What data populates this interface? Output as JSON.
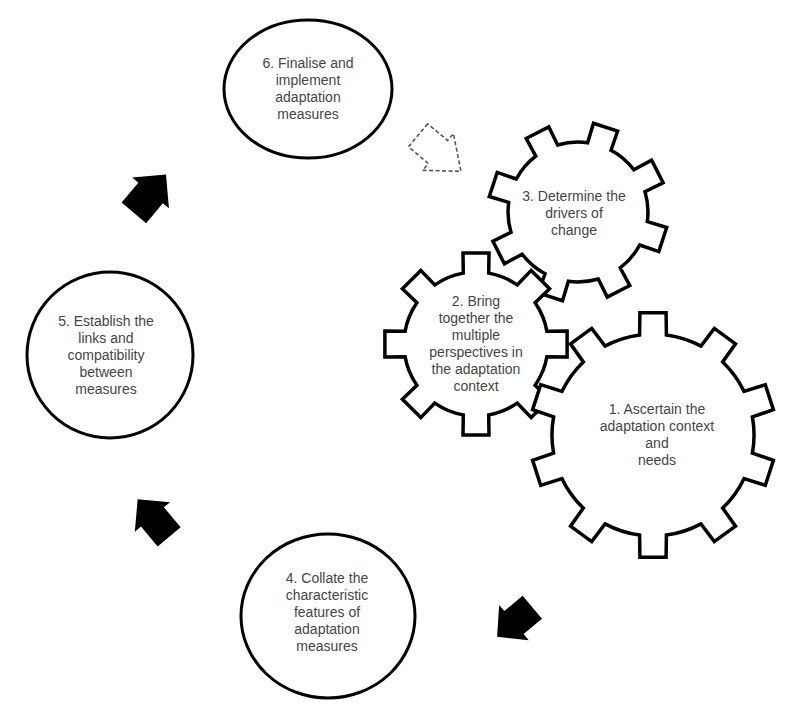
{
  "diagram": {
    "type": "cyclical process diagram",
    "colors": {
      "background": "#ffffff",
      "stroke": "#000000",
      "text": "#454545",
      "arrow_fill": "#000000",
      "dashed_arrow_stroke": "#555555"
    },
    "steps": [
      {
        "id": 1,
        "shape": "gear",
        "text": "1. Ascertain the\nadaptation context  and\nneeds"
      },
      {
        "id": 2,
        "shape": "gear",
        "text": "2. Bring\ntogether the\nmultiple\nperspectives in\nthe adaptation\ncontext"
      },
      {
        "id": 3,
        "shape": "gear",
        "text": "3. Determine the\ndrivers of\nchange"
      },
      {
        "id": 4,
        "shape": "circle",
        "text": "4. Collate the\ncharacteristic\nfeatures of\nadaptation\nmeasures"
      },
      {
        "id": 5,
        "shape": "circle",
        "text": "5. Establish the\nlinks and\ncompatibility\nbetween\nmeasures"
      },
      {
        "id": 6,
        "shape": "circle",
        "text": "6. Finalise and\nimplement\nadaptation\nmeasures"
      }
    ],
    "arrows": [
      {
        "from": "gears",
        "to": 4,
        "style": "solid",
        "icon": "arrow-down-left"
      },
      {
        "from": 4,
        "to": 5,
        "style": "solid",
        "icon": "arrow-up-left"
      },
      {
        "from": 5,
        "to": 6,
        "style": "solid",
        "icon": "arrow-up-right"
      },
      {
        "from": 6,
        "to": "gears",
        "style": "dashed",
        "icon": "arrow-down-right"
      }
    ]
  }
}
